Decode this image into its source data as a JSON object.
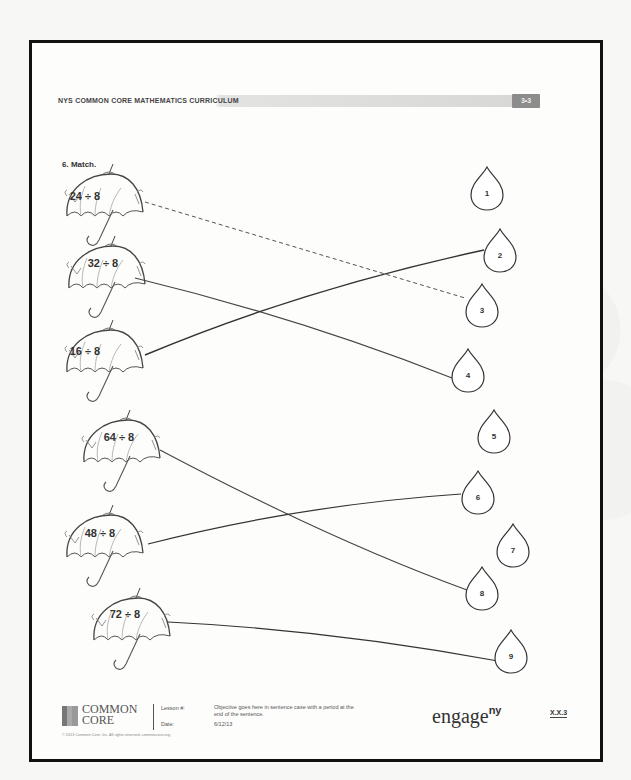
{
  "header": {
    "curriculum_title": "NYS COMMON CORE MATHEMATICS CURRICULUM",
    "module_badge": "3•3"
  },
  "question": {
    "label": "6. Match."
  },
  "umbrellas": [
    {
      "expression": "24 ÷ 8",
      "x": 85,
      "y": 196
    },
    {
      "expression": "32 ÷ 8",
      "x": 103,
      "y": 263
    },
    {
      "expression": "16 ÷ 8",
      "x": 85,
      "y": 351
    },
    {
      "expression": "64 ÷ 8",
      "x": 119,
      "y": 437
    },
    {
      "expression": "48 ÷ 8",
      "x": 100,
      "y": 533
    },
    {
      "expression": "72 ÷ 8",
      "x": 125,
      "y": 614
    }
  ],
  "raindrops": [
    {
      "number": "1",
      "x": 487,
      "y": 193
    },
    {
      "number": "2",
      "x": 500,
      "y": 255
    },
    {
      "number": "3",
      "x": 482,
      "y": 310
    },
    {
      "number": "4",
      "x": 468,
      "y": 375
    },
    {
      "number": "5",
      "x": 494,
      "y": 436
    },
    {
      "number": "6",
      "x": 478,
      "y": 497
    },
    {
      "number": "7",
      "x": 513,
      "y": 550
    },
    {
      "number": "8",
      "x": 482,
      "y": 593
    },
    {
      "number": "9",
      "x": 511,
      "y": 656
    }
  ],
  "matches": [
    {
      "from": "24 ÷ 8",
      "to": "3",
      "style": "dashed"
    },
    {
      "from": "32 ÷ 8",
      "to": "4",
      "style": "solid"
    },
    {
      "from": "16 ÷ 8",
      "to": "2",
      "style": "solid"
    },
    {
      "from": "64 ÷ 8",
      "to": "8",
      "style": "solid"
    },
    {
      "from": "48 ÷ 8",
      "to": "6",
      "style": "solid"
    },
    {
      "from": "72 ÷ 8",
      "to": "9",
      "style": "solid"
    }
  ],
  "footer": {
    "logo_line1": "COMMON",
    "logo_line2": "CORE",
    "lesson_label": "Lesson #:",
    "date_label": "Date:",
    "objective": "Objective goes here in sentence case with a period at the end of the sentence.",
    "date": "6/12/13",
    "copyright": "© 2013 Common Core, Inc. All rights reserved. commoncore.org",
    "brand": "engage",
    "brand_sup": "ny",
    "page_code": "X.X.3"
  },
  "colors": {
    "frame": "#111111",
    "ink": "#333333",
    "badge": "#8c8c8c"
  }
}
